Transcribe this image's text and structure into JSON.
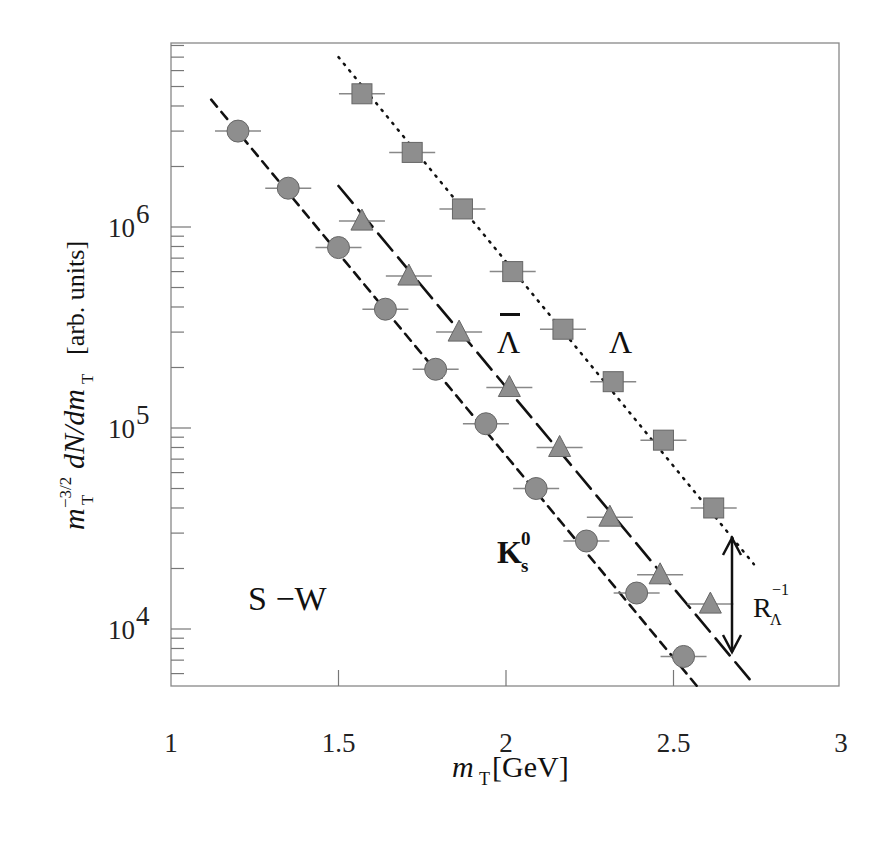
{
  "chart_data": {
    "type": "scatter",
    "title": "",
    "xlabel": "m_T [GeV]",
    "ylabel": "m_T^{-3/2} dN/dm_T [arb. units]",
    "xlim": [
      1,
      3
    ],
    "ylim": [
      5200,
      8300000
    ],
    "yscale": "log",
    "x_ticks": [
      1,
      1.5,
      2,
      2.5,
      3
    ],
    "x_tick_labels": [
      "1",
      "1.5",
      "2",
      "2.5",
      "3"
    ],
    "y_ticks": [
      10000,
      100000,
      1000000
    ],
    "y_tick_labels": [
      "10^4",
      "10^5",
      "10^6"
    ],
    "grid": false,
    "legend": null,
    "annotations": [
      {
        "text": "S −W",
        "x": 1.38,
        "y": 17000
      },
      {
        "text": "K0s",
        "x": 2.0,
        "y": 25000
      },
      {
        "text": "Λ̄ (anti-Lambda)",
        "x": 2.0,
        "y": 240000
      },
      {
        "text": "Λ",
        "x": 2.39,
        "y": 240000
      },
      {
        "text": "R_Λ^-1",
        "x": 2.75,
        "y": 13500
      }
    ],
    "series": [
      {
        "name": "Lambda",
        "marker": "square",
        "fit_line": "dotted",
        "x": [
          1.57,
          1.72,
          1.87,
          2.02,
          2.17,
          2.32,
          2.47,
          2.62
        ],
        "values": [
          4600000,
          2350000,
          1230000,
          600000,
          310000,
          170000,
          87000,
          40000
        ]
      },
      {
        "name": "anti-Lambda",
        "marker": "triangle",
        "fit_line": "long-dashed",
        "x": [
          1.57,
          1.71,
          1.86,
          2.01,
          2.16,
          2.31,
          2.46,
          2.61
        ],
        "values": [
          1070000,
          570000,
          300000,
          159000,
          80000,
          36000,
          18600,
          13300
        ]
      },
      {
        "name": "K0s",
        "marker": "circle",
        "fit_line": "short-dashed",
        "x": [
          1.2,
          1.35,
          1.5,
          1.64,
          1.79,
          1.94,
          2.09,
          2.24,
          2.39,
          2.53
        ],
        "values": [
          3000000,
          1560000,
          790000,
          390000,
          196000,
          105000,
          50000,
          27400,
          15100,
          7300
        ]
      }
    ]
  },
  "labels": {
    "x_axis": "m",
    "x_axis_sub": "T",
    "x_axis_unit": " [GeV]",
    "y_axis_main": "dN/dm",
    "y_axis_unit": "[arb. units]",
    "system": "S −W",
    "kaon": "K",
    "lambda": "Λ",
    "antilambda": "Λ",
    "ratio": "R"
  }
}
